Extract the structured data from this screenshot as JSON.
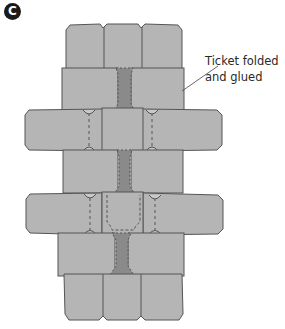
{
  "panel": {
    "label": "C"
  },
  "callout": {
    "line1": "Ticket folded",
    "line2": "and glued"
  },
  "colors": {
    "ticket_fill": "#b5b5b5",
    "ticket_stroke": "#555555",
    "glue_fill": "#8a8a8a",
    "text": "#2a2a2a",
    "badge": "#1a1a1a"
  },
  "diagram": {
    "rows": [
      {
        "name": "top-row",
        "tickets": 3,
        "orientation": "vertical"
      },
      {
        "name": "link-row-1",
        "tickets": 2,
        "glue": true
      },
      {
        "name": "wide-row-1",
        "tickets": 3,
        "orientation": "horizontal"
      },
      {
        "name": "link-row-2",
        "tickets": 2,
        "glue": true
      },
      {
        "name": "wide-row-2",
        "tickets": 3,
        "orientation": "horizontal"
      },
      {
        "name": "link-row-3",
        "tickets": 2,
        "glue": true
      },
      {
        "name": "bottom-row",
        "tickets": 3,
        "orientation": "vertical"
      }
    ]
  }
}
